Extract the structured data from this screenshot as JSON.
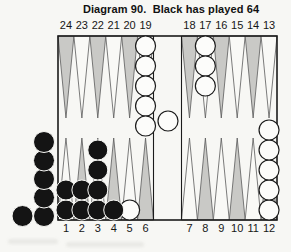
{
  "title": "Diagram 90.  Black has played 64",
  "board": {
    "top_labels": [
      "24",
      "23",
      "22",
      "21",
      "20",
      "19",
      "18",
      "17",
      "16",
      "15",
      "14",
      "13"
    ],
    "bottom_labels": [
      "1",
      "2",
      "3",
      "4",
      "5",
      "6",
      "7",
      "8",
      "9",
      "10",
      "11",
      "12"
    ]
  },
  "position": {
    "checkers_on_points": [
      {
        "point": 19,
        "color": "white",
        "count": 5
      },
      {
        "point": 17,
        "color": "white",
        "count": 3
      },
      {
        "point": 12,
        "color": "white",
        "count": 5
      },
      {
        "point": 5,
        "color": "white",
        "count": 1
      },
      {
        "point": 1,
        "color": "black",
        "count": 2
      },
      {
        "point": 2,
        "color": "black",
        "count": 2
      },
      {
        "point": 3,
        "color": "black",
        "count": 4
      },
      {
        "point": 4,
        "color": "black",
        "count": 1
      }
    ],
    "bar_checkers": [
      {
        "color": "white",
        "count": 1
      }
    ],
    "off_board_left": {
      "color": "black",
      "count": 6
    }
  },
  "colors": {
    "paper": "#f7f7f4",
    "point_dark": "#c9c9c6",
    "point_light": "#f9f9f6",
    "outline": "#1b1b1b",
    "triangle_stroke": "#5a5a5a",
    "checker_black": "#141414",
    "checker_white": "#fcfcfa",
    "text": "#111111"
  }
}
